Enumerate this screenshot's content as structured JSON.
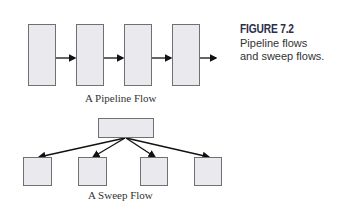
{
  "figure": {
    "label": "FIGURE 7.2",
    "description_line1": "Pipeline flows",
    "description_line2": "and sweep flows."
  },
  "pipeline": {
    "caption": "A Pipeline Flow",
    "stage_count": 4
  },
  "sweep": {
    "caption": "A Sweep Flow",
    "source_count": 1,
    "target_count": 4
  },
  "colors": {
    "box_fill": "#e9e9ee",
    "box_border": "#6f6f74",
    "arrow": "#111111",
    "label": "#2b2d4a"
  }
}
